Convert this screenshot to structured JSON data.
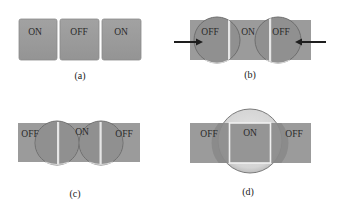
{
  "colors": {
    "box_fill": "#9a9a9a",
    "box_border": "#8a8a8a",
    "lens_fill": "#8e8e8e",
    "lens_stroke": "#6c6c6c",
    "lens_light_fill": "#d6d6d6",
    "divider": "#e4e4e4",
    "arrow": "#1e1e1e",
    "text": "#2a2a2a"
  },
  "panels": {
    "a": {
      "caption": "(a)",
      "labels": [
        "ON",
        "OFF",
        "ON"
      ]
    },
    "b": {
      "caption": "(b)",
      "labels": [
        "OFF",
        "ON",
        "OFF"
      ],
      "arrows": [
        "left-arrow pointing right into left circle",
        "right-arrow pointing left into right circle"
      ]
    },
    "c": {
      "caption": "(c)",
      "labels": [
        "OFF",
        "ON",
        "OFF"
      ]
    },
    "d": {
      "caption": "(d)",
      "labels": [
        "OFF",
        "ON",
        "OFF"
      ]
    }
  }
}
